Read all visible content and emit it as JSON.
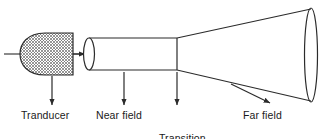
{
  "figure": {
    "background_color": "#ffffff",
    "line_color": "#2b2b2b",
    "text_color": "#1a1a1a",
    "hatch_color": "#555555"
  },
  "labels": {
    "transducer": "Tranducer",
    "near_field": "Near field",
    "transition_zone_line1": "Transition",
    "transition_zone_line2": "zone",
    "far_field": "Far field"
  },
  "shapes": {
    "lead_line": "horizontal lead-in line at left",
    "transducer_body": "bullet shaped hatched crystal element",
    "emission_arrow": "short right pointing arrow from transducer face",
    "near_field_cylinder": "straight sided cylinder with left ellipse cap",
    "transition_vertex": "vertical line where cylinder meets cone",
    "far_field_cone": "diverging cone ending in large ellipse"
  },
  "callouts": [
    {
      "name": "transducer",
      "style": "vertical-down-arrow"
    },
    {
      "name": "near-field",
      "style": "vertical-down-arrow"
    },
    {
      "name": "transition-zone",
      "style": "vertical-down-arrow"
    },
    {
      "name": "far-field",
      "style": "diagonal-down-right-arrow"
    }
  ]
}
